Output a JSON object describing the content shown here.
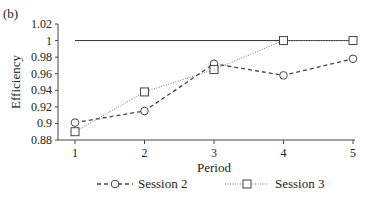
{
  "panel_label": "(b)",
  "chart_data": {
    "type": "line",
    "title": "",
    "xlabel": "Period",
    "ylabel": "Efficiency",
    "x": [
      1,
      2,
      3,
      4,
      5
    ],
    "ylim": [
      0.88,
      1.02
    ],
    "yticks": [
      "1.02",
      "1",
      "0.98",
      "0.96",
      "0.94",
      "0.92",
      "0.9",
      "0.88"
    ],
    "xticks": [
      "1",
      "2",
      "3",
      "4",
      "5"
    ],
    "grid": false,
    "legend_position": "bottom",
    "reference_line": {
      "y": 1.0,
      "style": "solid"
    },
    "series": [
      {
        "name": "Session 2",
        "marker": "circle",
        "line": "dashed",
        "values": [
          0.901,
          0.915,
          0.972,
          0.958,
          0.978
        ]
      },
      {
        "name": "Session 3",
        "marker": "square",
        "line": "dotted",
        "values": [
          0.89,
          0.938,
          0.965,
          1.0,
          1.0
        ]
      }
    ]
  },
  "legend": {
    "items": [
      {
        "label": "Session 2"
      },
      {
        "label": "Session 3"
      }
    ]
  }
}
